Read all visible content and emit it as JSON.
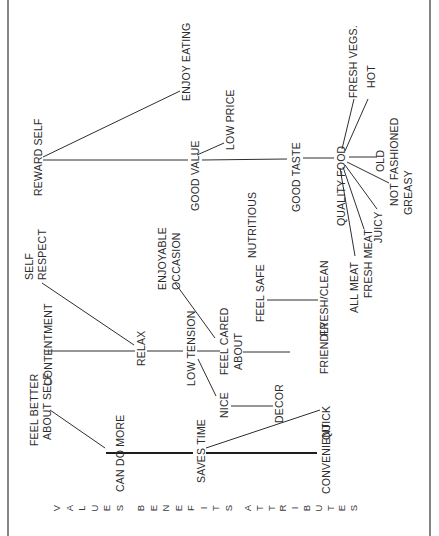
{
  "diagram": {
    "orientation": "rotated-90-ccw",
    "levels": {
      "values": "VALUES",
      "benefits": "BENEFITS",
      "attributes": "ATTRIBUTES"
    },
    "nodes": {
      "reward_self": "REWARD SELF",
      "enjoy_eating": "ENJOY EATING",
      "good_value": "GOOD VALUE",
      "low_price": "LOW PRICE",
      "nutritious": "NUTRITIOUS",
      "good_taste": "GOOD TASTE",
      "quality_food": "QUALITY FOOD",
      "fresh_vegs": "FRESH VEGS.",
      "hot": "HOT",
      "old_fashioned_1": "OLD",
      "old_fashioned_2": "FASHIONED",
      "not_greasy_1": "NOT",
      "not_greasy_2": "GREASY",
      "juicy": "JUICY",
      "fresh_meat": "FRESH MEAT",
      "all_meat": "ALL MEAT",
      "self_respect_1": "SELF",
      "self_respect_2": "RESPECT",
      "contentment": "CONTENTMENT",
      "relax": "RELAX",
      "enjoyable_occasion_1": "ENJOYABLE",
      "enjoyable_occasion_2": "OCCASION",
      "low_tension": "LOW TENSION",
      "feel_cared_about_1": "FEEL CARED",
      "feel_cared_about_2": "ABOUT",
      "feel_safe": "FEEL SAFE",
      "fresh_clean": "FRESH/CLEAN",
      "friendly": "FRIENDLY",
      "nice": "NICE",
      "decor": "DECOR",
      "feel_better_1": "FEEL BETTER",
      "feel_better_2": "ABOUT SELF",
      "can_do_more": "CAN DO MORE",
      "saves_time": "SAVES TIME",
      "quick": "QUICK",
      "convenient": "CONVENIENT"
    },
    "links": [
      [
        "REWARD SELF",
        "ENJOY EATING"
      ],
      [
        "REWARD SELF",
        "GOOD VALUE"
      ],
      [
        "GOOD VALUE",
        "LOW PRICE"
      ],
      [
        "GOOD VALUE",
        "GOOD TASTE"
      ],
      [
        "GOOD TASTE",
        "QUALITY FOOD"
      ],
      [
        "QUALITY FOOD",
        "FRESH VEGS."
      ],
      [
        "QUALITY FOOD",
        "HOT"
      ],
      [
        "QUALITY FOOD",
        "OLD FASHIONED"
      ],
      [
        "QUALITY FOOD",
        "NOT GREASY"
      ],
      [
        "QUALITY FOOD",
        "JUICY"
      ],
      [
        "QUALITY FOOD",
        "FRESH MEAT"
      ],
      [
        "QUALITY FOOD",
        "ALL MEAT"
      ],
      [
        "SELF RESPECT",
        "RELAX"
      ],
      [
        "CONTENTMENT",
        "RELAX"
      ],
      [
        "RELAX",
        "LOW TENSION"
      ],
      [
        "LOW TENSION",
        "FEEL CARED ABOUT"
      ],
      [
        "ENJOYABLE OCCASION",
        "FEEL CARED ABOUT"
      ],
      [
        "FEEL CARED ABOUT",
        "FRIENDLY"
      ],
      [
        "FEEL SAFE",
        "FRESH/CLEAN"
      ],
      [
        "LOW TENSION",
        "NICE"
      ],
      [
        "NICE",
        "DECOR"
      ],
      [
        "FEEL BETTER ABOUT SELF",
        "CAN DO MORE"
      ],
      [
        "CAN DO MORE",
        "SAVES TIME"
      ],
      [
        "SAVES TIME",
        "CONVENIENT"
      ],
      [
        "SAVES TIME",
        "QUICK"
      ]
    ]
  }
}
